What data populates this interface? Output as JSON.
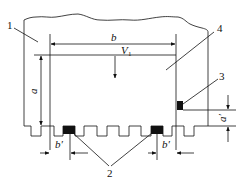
{
  "diagram": {
    "type": "engineering cross-section schematic",
    "callouts": [
      {
        "id": "1",
        "label": "1"
      },
      {
        "id": "2",
        "label": "2"
      },
      {
        "id": "3",
        "label": "3"
      },
      {
        "id": "4",
        "label": "4"
      }
    ],
    "dimensions": {
      "width": "b",
      "height": "a",
      "width_prime_left": "b′",
      "width_prime_right": "b′",
      "height_prime": "a′"
    },
    "velocity": {
      "symbol": "V",
      "subscript": "1"
    },
    "colors": {
      "line": "#111111",
      "fill_block": "#111111",
      "background": "#ffffff"
    }
  }
}
